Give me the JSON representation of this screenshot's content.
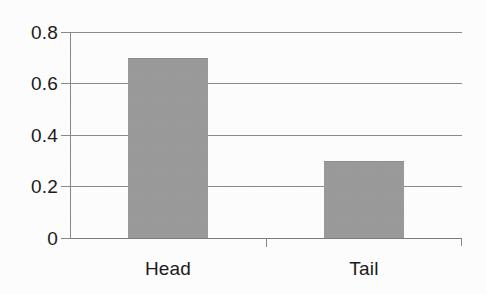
{
  "chart_data": {
    "type": "bar",
    "title": "",
    "subtitle": "",
    "xlabel": "",
    "ylabel": "",
    "categories": [
      "Head",
      "Tail"
    ],
    "values": [
      0.7,
      0.3
    ],
    "series": [
      {
        "name": "",
        "values": [
          0.7,
          0.3
        ]
      }
    ],
    "ylim": [
      0,
      0.8
    ],
    "y_ticks": [
      "0",
      "0.2",
      "0.4",
      "0.6",
      "0.8"
    ],
    "y_tick_values": [
      0,
      0.2,
      0.4,
      0.6,
      0.8
    ],
    "grid": true,
    "grid_axis": "y",
    "legend": false,
    "legend_position": "none",
    "bar_color": "#9b9b9b",
    "axis_color": "#8a8a8a",
    "text_color": "#1b1b1b",
    "background_color": "#fefefe",
    "annotations": []
  },
  "axis": {
    "y_ticks": [
      {
        "label": "0.8",
        "value": 0.8
      },
      {
        "label": "0.6",
        "value": 0.6
      },
      {
        "label": "0.4",
        "value": 0.4
      },
      {
        "label": "0.2",
        "value": 0.2
      },
      {
        "label": "0",
        "value": 0
      }
    ],
    "x_ticks": [
      {
        "label": "Head"
      },
      {
        "label": "Tail"
      }
    ]
  },
  "bars": [
    {
      "label": "Head",
      "value": 0.7
    },
    {
      "label": "Tail",
      "value": 0.3
    }
  ]
}
